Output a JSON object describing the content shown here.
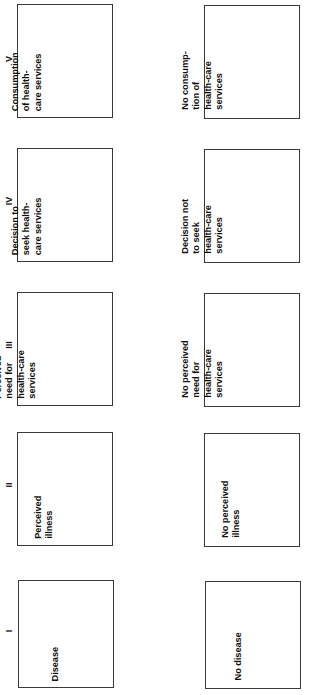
{
  "figure": {
    "orientation": "rotated-90-ccw",
    "type": "flowchart",
    "colors": {
      "box_border": "#3a3a3a",
      "box_fill": "#ffffff",
      "text": "#111111",
      "page_background": "#ffffff"
    }
  },
  "stages": [
    {
      "numeral": "V",
      "positive": "Consumption\nof health-\ncare services",
      "negative": "No consump-\ntion of\nhealth-care\nservices"
    },
    {
      "numeral": "IV",
      "positive": "Decision to\nseek health-\ncare services",
      "negative": "Decision not\nto seek\nhealth-care\nservices"
    },
    {
      "numeral": "III",
      "positive": "Perceived\nneed for\nhealth-care\nservices",
      "negative": "No perceived\nneed for\nhealth-care\nservices"
    },
    {
      "numeral": "II",
      "positive": "Perceived\nillness",
      "negative": "No perceived\nillness"
    },
    {
      "numeral": "I",
      "positive": "Disease",
      "negative": "No disease"
    }
  ]
}
